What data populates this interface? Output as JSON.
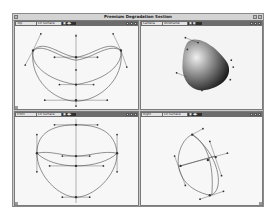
{
  "window": {
    "title": "Premium Degradation Section"
  },
  "viewports": [
    {
      "id": "top",
      "name": "Top",
      "mode": "Ctl Surface",
      "ctrl": "▣ ◀▶",
      "shading": "wireframe"
    },
    {
      "id": "camera",
      "name": "Camera",
      "mode": "Wireframe",
      "ctrl": "▣ ▣",
      "shading": "shaded"
    },
    {
      "id": "front",
      "name": "Front",
      "mode": "Ctl Surface",
      "ctrl": "▣ ◀▶",
      "shading": "wireframe"
    },
    {
      "id": "right",
      "name": "Right",
      "mode": "Ctl Surface",
      "ctrl": "▣ ◀▶",
      "shading": "wireframe"
    }
  ],
  "colors": {
    "curve": "#5a5a5a",
    "handle": "#333333",
    "header": "#6c6c6c"
  }
}
